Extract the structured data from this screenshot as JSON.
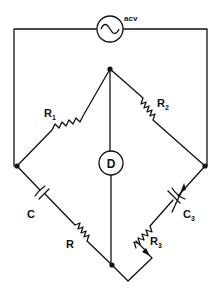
{
  "diagram": {
    "type": "ac-bridge-circuit",
    "stroke_color": "#111111",
    "background": "#ffffff",
    "source": {
      "label": "acv",
      "symbol": "sine-wave"
    },
    "detector": {
      "label": "D"
    },
    "components": [
      {
        "id": "R1",
        "label": "R",
        "subscript": "1",
        "type": "resistor"
      },
      {
        "id": "R2",
        "label": "R",
        "subscript": "2",
        "type": "resistor"
      },
      {
        "id": "C",
        "label": "C",
        "subscript": "",
        "type": "capacitor"
      },
      {
        "id": "R",
        "label": "R",
        "subscript": "",
        "type": "resistor"
      },
      {
        "id": "C3",
        "label": "C",
        "subscript": "3",
        "type": "variable-capacitor"
      },
      {
        "id": "R3",
        "label": "R",
        "subscript": "3",
        "type": "potentiometer"
      }
    ]
  }
}
